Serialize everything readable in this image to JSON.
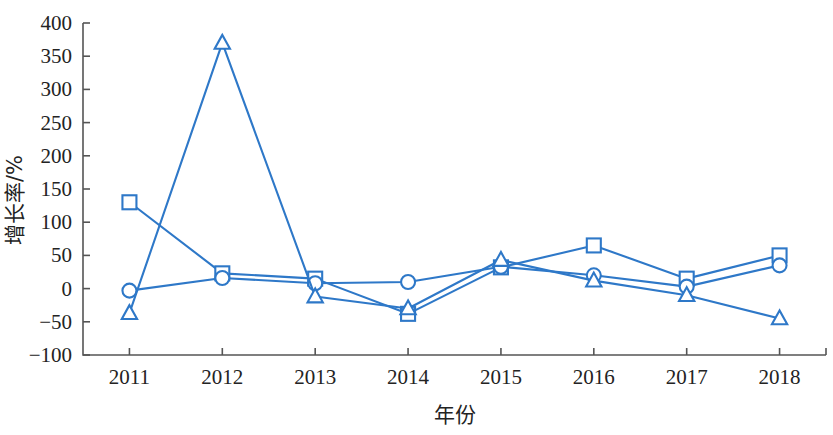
{
  "chart_data": {
    "type": "line",
    "title": "",
    "xlabel": "年份",
    "ylabel": "增长率/%",
    "categories": [
      "2011",
      "2012",
      "2013",
      "2014",
      "2015",
      "2016",
      "2017",
      "2018"
    ],
    "x": [
      2011,
      2012,
      2013,
      2014,
      2015,
      2016,
      2017,
      2018
    ],
    "ylim": [
      -100,
      400
    ],
    "xlim": [
      2010.7,
      2018.3
    ],
    "yticks": [
      -100,
      -50,
      0,
      50,
      100,
      150,
      200,
      250,
      300,
      350,
      400
    ],
    "ytick_labels": [
      "-100",
      "-50",
      "0",
      "50",
      "100",
      "150",
      "200",
      "250",
      "300",
      "350",
      "400"
    ],
    "grid": false,
    "legend": "none",
    "series": [
      {
        "name": "series-square",
        "marker": "square",
        "color": "#2E78C8",
        "values": [
          130,
          23,
          15,
          -38,
          32,
          65,
          15,
          50
        ]
      },
      {
        "name": "series-circle",
        "marker": "circle",
        "color": "#2E78C8",
        "values": [
          -3,
          16,
          8,
          10,
          33,
          20,
          3,
          35
        ]
      },
      {
        "name": "series-triangle",
        "marker": "triangle",
        "color": "#2E78C8",
        "values": [
          -37,
          370,
          -12,
          -30,
          43,
          12,
          -10,
          -45
        ]
      }
    ]
  },
  "colors": {
    "accent": "#2E78C8",
    "axis": "#555555",
    "text": "#232323",
    "background": "#FFFFFF"
  }
}
